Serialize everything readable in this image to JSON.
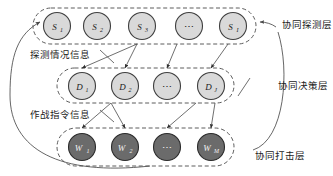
{
  "diagram": {
    "colors": {
      "node_light_fill": "#d9d9d9",
      "node_light_stroke": "#3f3f3f",
      "node_dark_fill": "#6b6b6b",
      "node_dark_stroke": "#2b2b2b",
      "container_stroke": "#4a4a4a",
      "arrow_stroke": "#4a4a4a",
      "text": "#1b1b1b",
      "background": "#ffffff"
    },
    "layers": [
      {
        "id": "detection-layer",
        "right_label": "协同探测层",
        "nodes": [
          {
            "id": "s1",
            "base": "S",
            "sub": "1",
            "kind": "light"
          },
          {
            "id": "s2",
            "base": "S",
            "sub": "2",
            "kind": "light"
          },
          {
            "id": "s3",
            "base": "S",
            "sub": "3",
            "kind": "light"
          },
          {
            "id": "s-ellipsis",
            "base": "⋯",
            "sub": "",
            "kind": "light"
          },
          {
            "id": "si",
            "base": "S",
            "sub": "I",
            "kind": "light"
          }
        ]
      },
      {
        "id": "decision-layer",
        "right_label": "协同决策层",
        "nodes": [
          {
            "id": "d1",
            "base": "D",
            "sub": "1",
            "kind": "light"
          },
          {
            "id": "d2",
            "base": "D",
            "sub": "2",
            "kind": "light"
          },
          {
            "id": "d-ellipsis",
            "base": "⋯",
            "sub": "",
            "kind": "light"
          },
          {
            "id": "dj",
            "base": "D",
            "sub": "J",
            "kind": "light"
          }
        ]
      },
      {
        "id": "strike-layer",
        "right_label": "协同打击层",
        "nodes": [
          {
            "id": "w1",
            "base": "W",
            "sub": "1",
            "kind": "dark"
          },
          {
            "id": "w2",
            "base": "W",
            "sub": "2",
            "kind": "dark"
          },
          {
            "id": "w-ellipsis",
            "base": "⋯",
            "sub": "",
            "kind": "dark"
          },
          {
            "id": "wm",
            "base": "W",
            "sub": "M",
            "kind": "dark"
          }
        ]
      }
    ],
    "flow_labels": [
      {
        "id": "detection-info",
        "text": "探测情况信息"
      },
      {
        "id": "command-info",
        "text": "作战指令信息"
      }
    ]
  }
}
